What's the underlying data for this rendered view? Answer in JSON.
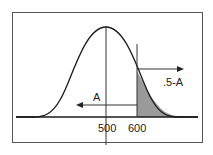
{
  "diagram": {
    "type": "normal-distribution",
    "mean_label": "500",
    "value_label": "600",
    "left_area_label": "A",
    "right_area_label": ".5-A",
    "shaded_region": "right tail beyond 600",
    "colors": {
      "frame": "#555555",
      "curve": "#1a1a1a",
      "shade": "#9a9a9a"
    }
  }
}
